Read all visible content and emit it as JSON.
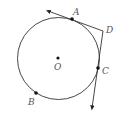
{
  "diagram": {
    "type": "circle-with-tangents",
    "circle": {
      "center_label": "O",
      "cx": 58.5,
      "cy": 58.5,
      "r": 41
    },
    "points": [
      {
        "id": "A",
        "label": "A",
        "x": 72,
        "y": 19,
        "lx": 75,
        "ly": 13,
        "on_circle": true
      },
      {
        "id": "B",
        "label": "B",
        "x": 36,
        "y": 93,
        "lx": 30,
        "ly": 104,
        "on_circle": true
      },
      {
        "id": "C",
        "label": "C",
        "x": 98,
        "y": 68,
        "lx": 103,
        "ly": 75,
        "on_circle": true
      },
      {
        "id": "D",
        "label": "D",
        "x": 103,
        "y": 31,
        "lx": 107,
        "ly": 32,
        "on_circle": false
      },
      {
        "id": "O",
        "label": "O",
        "x": 58,
        "y": 58,
        "lx": 55,
        "ly": 70,
        "on_circle": false
      }
    ],
    "lines": [
      {
        "name": "tangent-DA-ray",
        "from": "D",
        "through": "A",
        "arrow_end": [
          48,
          11
        ]
      },
      {
        "name": "tangent-DC-ray",
        "from": "D",
        "through": "C",
        "arrow_end": [
          92,
          108
        ]
      }
    ],
    "colors": {
      "stroke": "#333333",
      "point": "#111111",
      "label": "#555555"
    }
  }
}
